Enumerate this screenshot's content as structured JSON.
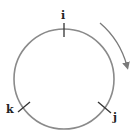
{
  "diagram": {
    "type": "circular-order",
    "nodes": [
      {
        "label": "i",
        "position": "top"
      },
      {
        "label": "j",
        "position": "bottom-right"
      },
      {
        "label": "k",
        "position": "bottom-left"
      }
    ],
    "arrow": {
      "direction": "clockwise"
    },
    "colors": {
      "circle": "#8a8a8a",
      "tick": "#333333",
      "arrow": "#7a7a7a",
      "label": "#222222"
    }
  }
}
